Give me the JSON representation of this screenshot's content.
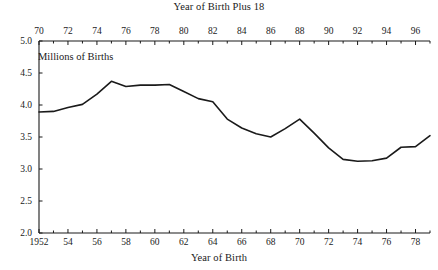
{
  "chart_data": {
    "type": "line",
    "title": "",
    "xlabel": "Year of Birth",
    "top_xlabel": "Year of Birth Plus 18",
    "ylabel": "Millions of Births",
    "ylim": [
      2.0,
      5.0
    ],
    "xlim": [
      1952,
      1979
    ],
    "top_xlim": [
      1970,
      1997
    ],
    "grid": false,
    "legend": "none",
    "yticks": [
      "2.0",
      "2.5",
      "3.0",
      "3.5",
      "4.0",
      "4.5",
      "5.0"
    ],
    "ytick_values": [
      2.0,
      2.5,
      3.0,
      3.5,
      4.0,
      4.5,
      5.0
    ],
    "xticks": [
      "1952",
      "54",
      "56",
      "58",
      "60",
      "62",
      "64",
      "66",
      "68",
      "70",
      "72",
      "74",
      "76",
      "78"
    ],
    "xtick_values": [
      1952,
      1954,
      1956,
      1958,
      1960,
      1962,
      1964,
      1966,
      1968,
      1970,
      1972,
      1974,
      1976,
      1978
    ],
    "top_xticks": [
      "70",
      "72",
      "74",
      "76",
      "78",
      "80",
      "82",
      "84",
      "86",
      "88",
      "90",
      "92",
      "94",
      "96"
    ],
    "top_xtick_values": [
      1970,
      1972,
      1974,
      1976,
      1978,
      1980,
      1982,
      1984,
      1986,
      1988,
      1990,
      1992,
      1994,
      1996
    ],
    "x": [
      1952,
      1953,
      1954,
      1955,
      1956,
      1957,
      1958,
      1959,
      1960,
      1961,
      1962,
      1963,
      1964,
      1965,
      1966,
      1967,
      1968,
      1969,
      1970,
      1971,
      1972,
      1973,
      1974,
      1975,
      1976,
      1977,
      1978,
      1979
    ],
    "values": [
      3.89,
      3.9,
      3.96,
      4.01,
      4.17,
      4.37,
      4.29,
      4.31,
      4.31,
      4.32,
      4.21,
      4.1,
      4.05,
      3.78,
      3.64,
      3.55,
      3.5,
      3.63,
      3.78,
      3.56,
      3.33,
      3.15,
      3.12,
      3.13,
      3.17,
      3.34,
      3.35,
      3.52
    ],
    "line_color": "#1a1a1a",
    "axis_color": "#1a1a1a"
  }
}
